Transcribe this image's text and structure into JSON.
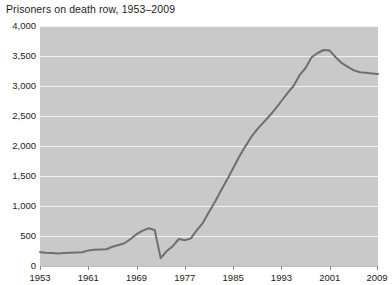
{
  "chart_data": {
    "type": "line",
    "title": "Prisoners on death row, 1953–2009",
    "xlabel": "",
    "ylabel": "",
    "xlim": [
      1953,
      2009
    ],
    "ylim": [
      0,
      4000
    ],
    "grid": true,
    "legend": null,
    "line_color": "#6f6f6f",
    "plot_background": "#c9c9c9",
    "gridline_color": "#f2f2f2",
    "y_ticks": [
      0,
      500,
      1000,
      1500,
      2000,
      2500,
      3000,
      3500,
      4000
    ],
    "y_tick_labels": [
      "0",
      "500",
      "1,000",
      "1,500",
      "2,000",
      "2,500",
      "3,000",
      "3,500",
      "4,000"
    ],
    "x_ticks": [
      1953,
      1961,
      1969,
      1977,
      1985,
      1993,
      2001,
      2009
    ],
    "x_tick_labels": [
      "1953",
      "1961",
      "1969",
      "1977",
      "1985",
      "1993",
      "2001",
      "2009"
    ],
    "x": [
      1953,
      1954,
      1955,
      1956,
      1957,
      1958,
      1959,
      1960,
      1961,
      1962,
      1963,
      1964,
      1965,
      1966,
      1967,
      1968,
      1969,
      1970,
      1971,
      1972,
      1973,
      1974,
      1975,
      1976,
      1977,
      1978,
      1979,
      1980,
      1981,
      1982,
      1983,
      1984,
      1985,
      1986,
      1987,
      1988,
      1989,
      1990,
      1991,
      1992,
      1993,
      1994,
      1995,
      1996,
      1997,
      1998,
      1999,
      2000,
      2001,
      2002,
      2003,
      2004,
      2005,
      2006,
      2007,
      2008,
      2009
    ],
    "values": [
      230,
      220,
      215,
      210,
      215,
      220,
      225,
      230,
      260,
      270,
      275,
      280,
      320,
      350,
      380,
      450,
      530,
      590,
      630,
      600,
      130,
      250,
      330,
      450,
      430,
      460,
      600,
      720,
      900,
      1070,
      1260,
      1440,
      1630,
      1820,
      1990,
      2150,
      2280,
      2390,
      2500,
      2620,
      2750,
      2880,
      3000,
      3180,
      3300,
      3480,
      3550,
      3600,
      3590,
      3480,
      3380,
      3320,
      3260,
      3230,
      3220,
      3210,
      3200
    ]
  }
}
